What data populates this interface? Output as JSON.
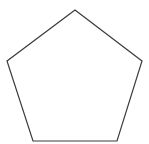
{
  "diagram": {
    "shape": "pentagon",
    "width": 149,
    "height": 144,
    "background": "#ffffff",
    "stroke": "#3a3a3a",
    "stroke_width": 1.2,
    "fill": "none",
    "vertices": [
      [
        75,
        10
      ],
      [
        142,
        61
      ],
      [
        117,
        141
      ],
      [
        33,
        141
      ],
      [
        7,
        61
      ]
    ]
  }
}
